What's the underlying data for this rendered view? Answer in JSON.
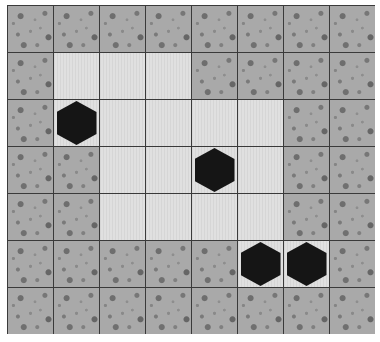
{
  "game": {
    "rows": 7,
    "cols": 8,
    "legend": {
      "W": "wall",
      "F": "floor",
      "B": "block"
    },
    "colors": {
      "wall": "#a9a9a9",
      "floor": "#dcdcdc",
      "grid_line": "#3a3a3a",
      "block": "#151515"
    },
    "map": [
      [
        "W",
        "W",
        "W",
        "W",
        "W",
        "W",
        "W",
        "W"
      ],
      [
        "W",
        "F",
        "F",
        "F",
        "W",
        "W",
        "W",
        "W"
      ],
      [
        "W",
        "B",
        "F",
        "F",
        "F",
        "F",
        "W",
        "W"
      ],
      [
        "W",
        "W",
        "F",
        "F",
        "B",
        "F",
        "W",
        "W"
      ],
      [
        "W",
        "W",
        "F",
        "F",
        "F",
        "F",
        "W",
        "W"
      ],
      [
        "W",
        "W",
        "W",
        "W",
        "W",
        "B",
        "B",
        "W"
      ],
      [
        "W",
        "W",
        "W",
        "W",
        "W",
        "W",
        "W",
        "W"
      ]
    ],
    "blocks": [
      {
        "row": 2,
        "col": 1
      },
      {
        "row": 3,
        "col": 4
      },
      {
        "row": 5,
        "col": 5
      },
      {
        "row": 5,
        "col": 6
      }
    ]
  }
}
